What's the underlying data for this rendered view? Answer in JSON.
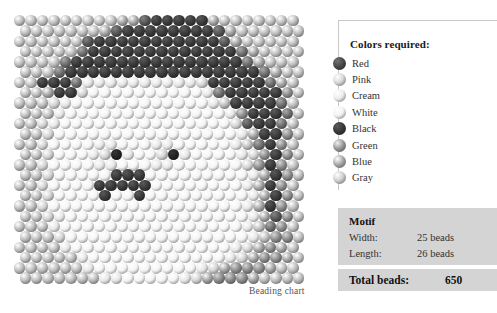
{
  "caption": "Beading chart",
  "legend": {
    "title": "Colors required:",
    "items": [
      {
        "label": "Red",
        "swatch": "#4a4a4a"
      },
      {
        "label": "Pink",
        "swatch": "#d8d8d8"
      },
      {
        "label": "Cream",
        "swatch": "#ededed"
      },
      {
        "label": "White",
        "swatch": "#f3f3f3"
      },
      {
        "label": "Black",
        "swatch": "#3a3a3a"
      },
      {
        "label": "Green",
        "swatch": "#9a9a9a"
      },
      {
        "label": "Blue",
        "swatch": "#a8a8a8"
      },
      {
        "label": "Gray",
        "swatch": "#cfcfcf"
      }
    ]
  },
  "motif": {
    "title": "Motif",
    "width_label": "Width:",
    "width_value": "25 beads",
    "length_label": "Length:",
    "length_value": "26 beads",
    "total_label": "Total beads:",
    "total_value": "650"
  },
  "chart_data": {
    "type": "heatmap",
    "title": "Beading chart",
    "xlabel": "",
    "ylabel": "",
    "grid": false,
    "legend_position": "right",
    "cols": 25,
    "rows": 26,
    "total_beads": 650,
    "palette": {
      "0": "#f4f4f4",
      "1": "#e6e6e6",
      "2": "#d2d2d2",
      "3": "#bcbcbc",
      "4": "#a2a2a2",
      "5": "#8a8a8a",
      "6": "#6e6e6e",
      "7": "#555555",
      "8": "#3a3a3a",
      "9": "#242424"
    },
    "palette_names": {
      "0": "White",
      "1": "Cream",
      "2": "Pink",
      "3": "Gray",
      "4": "Blue",
      "5": "Green",
      "6": "Green",
      "7": "Red",
      "8": "Black",
      "9": "Black"
    },
    "row_offsets": [
      0,
      1,
      0,
      1,
      0,
      1,
      0,
      1,
      0,
      1,
      0,
      1,
      0,
      1,
      0,
      1,
      0,
      1,
      0,
      1,
      0,
      1,
      0,
      1,
      0,
      1
    ],
    "values": [
      [
        3,
        3,
        3,
        3,
        3,
        3,
        3,
        3,
        3,
        4,
        4,
        7,
        8,
        8,
        8,
        8,
        8,
        4,
        3,
        3,
        3,
        3,
        3,
        3,
        3
      ],
      [
        3,
        3,
        3,
        3,
        3,
        3,
        3,
        4,
        7,
        8,
        8,
        8,
        8,
        8,
        8,
        8,
        8,
        7,
        4,
        3,
        3,
        3,
        3,
        3,
        3
      ],
      [
        3,
        3,
        3,
        3,
        3,
        3,
        7,
        8,
        8,
        8,
        8,
        8,
        8,
        8,
        8,
        8,
        8,
        8,
        7,
        4,
        3,
        3,
        3,
        3,
        3
      ],
      [
        3,
        3,
        3,
        3,
        3,
        6,
        8,
        8,
        8,
        8,
        8,
        8,
        8,
        8,
        8,
        8,
        8,
        8,
        8,
        6,
        4,
        3,
        3,
        3,
        3
      ],
      [
        3,
        3,
        3,
        3,
        6,
        8,
        8,
        8,
        8,
        8,
        8,
        8,
        8,
        8,
        8,
        8,
        8,
        8,
        8,
        8,
        6,
        4,
        3,
        3,
        3
      ],
      [
        3,
        3,
        3,
        6,
        8,
        8,
        8,
        8,
        8,
        8,
        8,
        8,
        8,
        8,
        8,
        8,
        8,
        8,
        8,
        8,
        8,
        6,
        4,
        3,
        3
      ],
      [
        3,
        3,
        8,
        8,
        8,
        6,
        1,
        1,
        1,
        1,
        1,
        1,
        1,
        1,
        1,
        1,
        2,
        8,
        8,
        8,
        8,
        8,
        6,
        4,
        3
      ],
      [
        3,
        3,
        4,
        8,
        8,
        2,
        0,
        0,
        0,
        0,
        0,
        0,
        0,
        0,
        0,
        0,
        1,
        6,
        8,
        8,
        8,
        8,
        8,
        5,
        3
      ],
      [
        3,
        3,
        3,
        2,
        1,
        0,
        0,
        0,
        0,
        0,
        0,
        0,
        0,
        0,
        0,
        0,
        0,
        1,
        3,
        8,
        8,
        8,
        8,
        6,
        3
      ],
      [
        3,
        3,
        3,
        1,
        0,
        0,
        0,
        0,
        0,
        0,
        0,
        0,
        0,
        0,
        0,
        0,
        0,
        0,
        1,
        5,
        8,
        8,
        8,
        6,
        3
      ],
      [
        3,
        3,
        2,
        1,
        0,
        0,
        0,
        0,
        0,
        0,
        0,
        0,
        0,
        0,
        0,
        0,
        0,
        0,
        0,
        2,
        7,
        8,
        8,
        6,
        3
      ],
      [
        3,
        3,
        2,
        0,
        0,
        0,
        0,
        0,
        0,
        0,
        0,
        0,
        0,
        0,
        0,
        0,
        0,
        0,
        0,
        1,
        4,
        8,
        8,
        5,
        3
      ],
      [
        3,
        3,
        2,
        0,
        0,
        0,
        0,
        1,
        1,
        0,
        0,
        0,
        1,
        1,
        0,
        0,
        0,
        0,
        0,
        1,
        3,
        6,
        8,
        5,
        3
      ],
      [
        3,
        3,
        2,
        0,
        0,
        0,
        1,
        2,
        9,
        1,
        0,
        0,
        2,
        9,
        1,
        0,
        0,
        0,
        0,
        1,
        2,
        5,
        8,
        5,
        3
      ],
      [
        3,
        3,
        2,
        0,
        0,
        0,
        0,
        1,
        1,
        0,
        0,
        0,
        1,
        1,
        0,
        0,
        0,
        0,
        0,
        0,
        2,
        5,
        8,
        5,
        3
      ],
      [
        3,
        3,
        2,
        0,
        0,
        0,
        0,
        0,
        8,
        8,
        8,
        0,
        0,
        0,
        0,
        0,
        0,
        0,
        0,
        0,
        1,
        4,
        8,
        5,
        3
      ],
      [
        3,
        3,
        2,
        0,
        0,
        0,
        0,
        8,
        8,
        8,
        8,
        8,
        0,
        0,
        0,
        0,
        0,
        0,
        0,
        0,
        1,
        4,
        8,
        5,
        3
      ],
      [
        3,
        3,
        2,
        0,
        0,
        0,
        0,
        8,
        0,
        0,
        8,
        0,
        0,
        0,
        0,
        0,
        0,
        0,
        0,
        0,
        1,
        4,
        8,
        5,
        3
      ],
      [
        3,
        3,
        2,
        0,
        0,
        0,
        0,
        0,
        0,
        0,
        0,
        0,
        0,
        0,
        0,
        0,
        0,
        0,
        0,
        0,
        1,
        4,
        8,
        5,
        3
      ],
      [
        3,
        3,
        2,
        1,
        0,
        0,
        0,
        0,
        0,
        0,
        0,
        0,
        0,
        0,
        0,
        0,
        0,
        0,
        0,
        0,
        1,
        4,
        7,
        5,
        3
      ],
      [
        3,
        3,
        3,
        1,
        0,
        0,
        0,
        0,
        0,
        0,
        0,
        0,
        0,
        0,
        0,
        0,
        0,
        0,
        0,
        0,
        1,
        3,
        6,
        5,
        3
      ],
      [
        3,
        3,
        3,
        2,
        0,
        0,
        0,
        0,
        0,
        0,
        0,
        0,
        0,
        0,
        0,
        0,
        0,
        0,
        0,
        0,
        1,
        3,
        5,
        5,
        3
      ],
      [
        3,
        3,
        3,
        3,
        1,
        0,
        0,
        0,
        0,
        0,
        0,
        0,
        0,
        0,
        0,
        0,
        0,
        0,
        0,
        1,
        2,
        4,
        5,
        4,
        3
      ],
      [
        3,
        3,
        3,
        3,
        3,
        1,
        0,
        0,
        0,
        0,
        0,
        0,
        0,
        0,
        0,
        0,
        0,
        0,
        1,
        2,
        4,
        5,
        5,
        4,
        3
      ],
      [
        3,
        3,
        3,
        3,
        3,
        3,
        1,
        0,
        0,
        0,
        0,
        0,
        0,
        0,
        0,
        0,
        1,
        2,
        4,
        5,
        5,
        5,
        4,
        3,
        3
      ],
      [
        3,
        3,
        3,
        3,
        3,
        3,
        3,
        1,
        1,
        0,
        0,
        0,
        0,
        0,
        1,
        2,
        4,
        5,
        5,
        5,
        4,
        3,
        3,
        3,
        3
      ]
    ]
  }
}
